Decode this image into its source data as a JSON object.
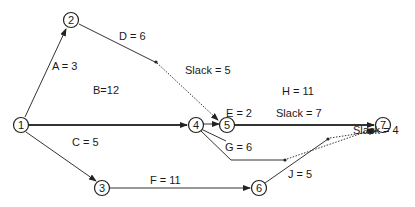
{
  "diagram": {
    "type": "activity-on-arrow network (CPM)",
    "nodes": [
      {
        "id": "1",
        "x": 21,
        "y": 125
      },
      {
        "id": "2",
        "x": 71,
        "y": 20
      },
      {
        "id": "3",
        "x": 102,
        "y": 188
      },
      {
        "id": "4",
        "x": 196,
        "y": 125
      },
      {
        "id": "5",
        "x": 227,
        "y": 125
      },
      {
        "id": "6",
        "x": 259,
        "y": 188
      },
      {
        "id": "7",
        "x": 383,
        "y": 125
      }
    ],
    "activities": [
      {
        "label": "A = 3",
        "from": "1",
        "to": "2",
        "critical": false
      },
      {
        "label": "B=12",
        "from": "1",
        "to": "4",
        "critical": true
      },
      {
        "label": "C = 5",
        "from": "1",
        "to": "3",
        "critical": false
      },
      {
        "label": "D = 6",
        "from": "2",
        "to": "5",
        "critical": false
      },
      {
        "label": "E = 2",
        "from": "4",
        "to": "5",
        "critical": false
      },
      {
        "label": "F = 11",
        "from": "3",
        "to": "6",
        "critical": false
      },
      {
        "label": "G = 6",
        "from": "4",
        "to": "7",
        "critical": false
      },
      {
        "label": "H = 11",
        "from": "5",
        "to": "7",
        "critical": true
      },
      {
        "label": "J = 5",
        "from": "6",
        "to": "7",
        "critical": false
      }
    ],
    "slacks": [
      {
        "label": "Slack = 5",
        "activity": "D"
      },
      {
        "label": "Slack = 7",
        "activity": "G"
      },
      {
        "label": "Slack = 4",
        "activity": "J"
      }
    ]
  }
}
